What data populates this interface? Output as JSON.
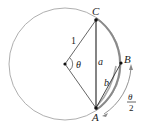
{
  "diagram": {
    "type": "geometry-circle-chord",
    "colors": {
      "circle": "#9a9a9a",
      "line": "#333333",
      "arc_highlight": "#8a8a8a",
      "point": "#111111"
    },
    "labels": {
      "C": "C",
      "A": "A",
      "B": "B",
      "radius": "1",
      "theta": "θ",
      "a": "a",
      "b": "b",
      "half_theta_num": "θ",
      "half_theta_den": "2"
    },
    "points": [
      "O",
      "A",
      "B",
      "C"
    ],
    "segments": [
      "OC",
      "OA",
      "CA",
      "AB"
    ]
  }
}
